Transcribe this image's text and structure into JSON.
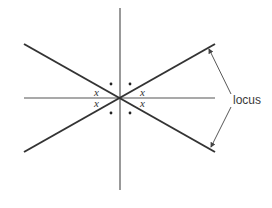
{
  "diagram": {
    "label_locus": "locus",
    "angle_label": "x",
    "colors": {
      "line": "#333333",
      "thin": "#555555"
    },
    "center": [
      120,
      98
    ],
    "axes": {
      "vertical": [
        [
          120,
          8
        ],
        [
          120,
          190
        ]
      ],
      "horizontal": [
        [
          24,
          98
        ],
        [
          215,
          98
        ]
      ]
    },
    "locus_lines": [
      [
        [
          24,
          44
        ],
        [
          215,
          152
        ]
      ],
      [
        [
          24,
          152
        ],
        [
          215,
          44
        ]
      ]
    ]
  }
}
